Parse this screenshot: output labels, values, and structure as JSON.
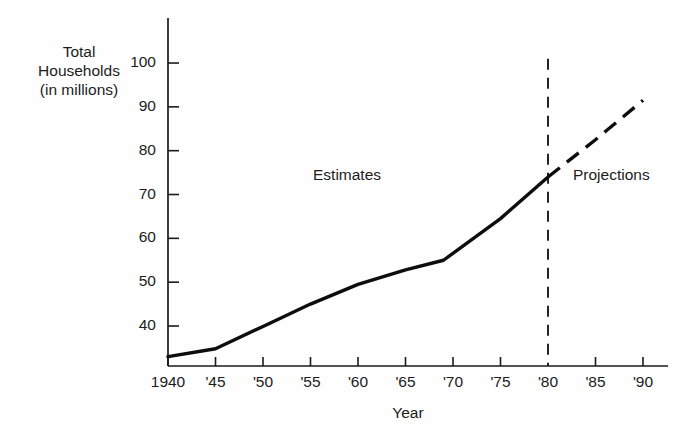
{
  "chart_data": {
    "type": "line",
    "title": "",
    "xlabel": "Year",
    "ylabel": "Total\nHouseholds\n(in millions)",
    "ylim": [
      32,
      104
    ],
    "xlim": [
      1940,
      1992
    ],
    "grid": false,
    "legend_position": "none",
    "y_ticks": [
      40,
      50,
      60,
      70,
      80,
      90,
      100
    ],
    "y_tick_labels": [
      "40",
      "50",
      "60",
      "70",
      "80",
      "90",
      "100"
    ],
    "x_ticks": [
      1940,
      1945,
      1950,
      1955,
      1960,
      1965,
      1970,
      1975,
      1980,
      1985,
      1990
    ],
    "x_tick_labels": [
      "1940",
      "'45",
      "'50",
      "'55",
      "'60",
      "'65",
      "'70",
      "'75",
      "'80",
      "'85",
      "'90"
    ],
    "series": [
      {
        "name": "Estimates",
        "style": "solid",
        "x": [
          1940,
          1945,
          1950,
          1955,
          1960,
          1965,
          1969,
          1975,
          1980
        ],
        "values": [
          33.0,
          34.8,
          39.9,
          45.0,
          49.5,
          52.8,
          55.0,
          64.5,
          74.0
        ]
      },
      {
        "name": "Projections",
        "style": "dashed",
        "x": [
          1980,
          1985,
          1990
        ],
        "values": [
          74.0,
          82.5,
          91.5
        ]
      }
    ],
    "annotations": [
      {
        "text": "Estimates",
        "x": 1956,
        "y": 76
      },
      {
        "text": "Projections",
        "x": 1983,
        "y": 76
      },
      {
        "text": "",
        "note": "vertical dashed divider at 1980 separating estimates from projections"
      }
    ],
    "divider": {
      "x": 1980,
      "style": "dashed",
      "y_from": 32,
      "y_to": 101
    },
    "colors": {
      "line": "#0d0d0d",
      "axis": "#1a1a1a",
      "background": "#fefefe",
      "text": "#1c1c1c"
    }
  },
  "axis": {
    "y_title": "Total\nHouseholds\n(in millions)",
    "x_title": "Year"
  },
  "regions": {
    "estimates": "Estimates",
    "projections": "Projections"
  }
}
